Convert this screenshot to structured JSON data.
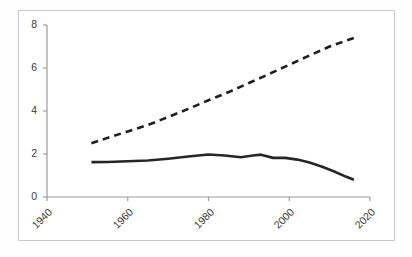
{
  "chart_data": {
    "type": "line",
    "title": "",
    "subtitle": "",
    "xlabel": "",
    "ylabel": "",
    "xlim": [
      1940,
      2020
    ],
    "ylim": [
      0,
      8
    ],
    "xticks": [
      1940,
      1960,
      1980,
      2000,
      2020
    ],
    "yticks": [
      0,
      2,
      4,
      6,
      8
    ],
    "xtick_labels": [
      "1940",
      "1960",
      "1980",
      "2000",
      "2020"
    ],
    "ytick_labels": [
      "0",
      "2",
      "4",
      "6",
      "8"
    ],
    "grid": false,
    "legend": null,
    "xtick_rotation": -45,
    "series": [
      {
        "name": "dashed-series",
        "style": "dashed",
        "color": "#1f1f1f",
        "x": [
          1951,
          1955,
          1960,
          1965,
          1970,
          1975,
          1980,
          1985,
          1990,
          1995,
          2000,
          2005,
          2010,
          2016
        ],
        "values": [
          2.5,
          2.75,
          3.05,
          3.35,
          3.72,
          4.1,
          4.5,
          4.88,
          5.3,
          5.72,
          6.15,
          6.58,
          7.0,
          7.4
        ]
      },
      {
        "name": "solid-series",
        "style": "solid",
        "color": "#262626",
        "x": [
          1951,
          1955,
          1960,
          1965,
          1970,
          1975,
          1980,
          1984,
          1988,
          1991,
          1993,
          1996,
          1999,
          2002,
          2005,
          2008,
          2011,
          2014,
          2016
        ],
        "values": [
          1.62,
          1.63,
          1.66,
          1.7,
          1.78,
          1.88,
          1.98,
          1.93,
          1.85,
          1.93,
          1.97,
          1.82,
          1.82,
          1.74,
          1.6,
          1.42,
          1.2,
          0.95,
          0.8
        ]
      }
    ],
    "axis_color": "#9a9a9a",
    "frame_color": "#c9c9c9",
    "background": "#ffffff"
  }
}
